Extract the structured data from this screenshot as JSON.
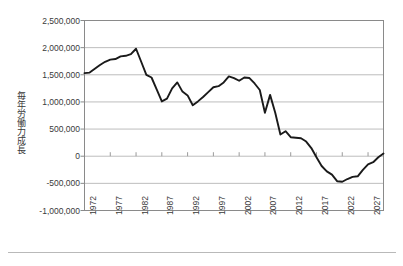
{
  "chart_data": {
    "type": "line",
    "title": "",
    "subtitle": "",
    "xlabel": "",
    "ylabel": "毎年労働力成長",
    "ylim": [
      -1000000,
      2500000
    ],
    "xlim": [
      1972,
      2030
    ],
    "grid": true,
    "legend_position": "none",
    "series_color": "#1a1a1a",
    "yticks": [
      "2,500,000",
      "2,000,000",
      "1,500,000",
      "1,000,000",
      "500,000",
      "0",
      "-500,000",
      "-1,000,000"
    ],
    "ytick_values": [
      2500000,
      2000000,
      1500000,
      1000000,
      500000,
      0,
      -500000,
      -1000000
    ],
    "xticks": [
      "1972",
      "1977",
      "1982",
      "1987",
      "1992",
      "1997",
      "2002",
      "2007",
      "2012",
      "2017",
      "2022",
      "2027"
    ],
    "xtick_values": [
      1972,
      1977,
      1982,
      1987,
      1992,
      1997,
      2002,
      2007,
      2012,
      2017,
      2022,
      2027
    ],
    "x": [
      1972,
      1973,
      1974,
      1975,
      1976,
      1977,
      1978,
      1979,
      1980,
      1981,
      1982,
      1983,
      1984,
      1985,
      1986,
      1987,
      1988,
      1989,
      1990,
      1991,
      1992,
      1993,
      1994,
      1995,
      1996,
      1997,
      1998,
      1999,
      2000,
      2001,
      2002,
      2003,
      2004,
      2005,
      2006,
      2007,
      2008,
      2009,
      2010,
      2011,
      2012,
      2013,
      2014,
      2015,
      2016,
      2017,
      2018,
      2019,
      2020,
      2021,
      2022,
      2023,
      2024,
      2025,
      2026,
      2027,
      2028,
      2029,
      2030
    ],
    "values": [
      1530000,
      1540000,
      1610000,
      1680000,
      1740000,
      1780000,
      1790000,
      1840000,
      1850000,
      1880000,
      1980000,
      1740000,
      1500000,
      1450000,
      1230000,
      1010000,
      1060000,
      1250000,
      1360000,
      1190000,
      1120000,
      940000,
      1010000,
      1090000,
      1180000,
      1270000,
      1290000,
      1360000,
      1470000,
      1440000,
      1390000,
      1450000,
      1440000,
      1340000,
      1220000,
      800000,
      1130000,
      800000,
      400000,
      460000,
      350000,
      340000,
      330000,
      270000,
      150000,
      -20000,
      -180000,
      -280000,
      -340000,
      -460000,
      -470000,
      -420000,
      -380000,
      -370000,
      -250000,
      -150000,
      -110000,
      -20000,
      50000
    ],
    "series": [
      {
        "name": "毎年労働力成長",
        "values": [
          1530000,
          1540000,
          1610000,
          1680000,
          1740000,
          1780000,
          1790000,
          1840000,
          1850000,
          1880000,
          1980000,
          1740000,
          1500000,
          1450000,
          1230000,
          1010000,
          1060000,
          1250000,
          1360000,
          1190000,
          1120000,
          940000,
          1010000,
          1090000,
          1180000,
          1270000,
          1290000,
          1360000,
          1470000,
          1440000,
          1390000,
          1450000,
          1440000,
          1340000,
          1220000,
          800000,
          1130000,
          800000,
          400000,
          460000,
          350000,
          340000,
          330000,
          270000,
          150000,
          -20000,
          -180000,
          -280000,
          -340000,
          -460000,
          -470000,
          -420000,
          -380000,
          -370000,
          -250000,
          -150000,
          -110000,
          -20000,
          50000
        ]
      }
    ]
  }
}
